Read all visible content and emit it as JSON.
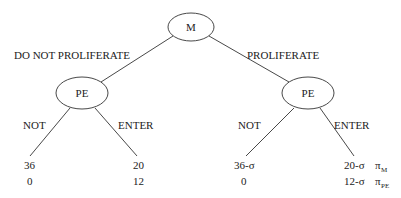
{
  "nodes": {
    "root": {
      "label": "M",
      "cx": 191,
      "cy": 27,
      "rx": 23,
      "ry": 14
    },
    "left": {
      "label": "PE",
      "cx": 82,
      "cy": 93,
      "rx": 26,
      "ry": 16
    },
    "right": {
      "label": "PE",
      "cx": 308,
      "cy": 93,
      "rx": 26,
      "ry": 16
    }
  },
  "actions": {
    "root_left": "DO NOT PROLIFERATE",
    "root_right": "PROLIFERATE",
    "left_not": "NOT",
    "left_enter": "ENTER",
    "right_not": "NOT",
    "right_enter": "ENTER"
  },
  "payoffs": {
    "ll": {
      "m": "36",
      "pe": "0"
    },
    "lr": {
      "m": "20",
      "pe": "12"
    },
    "rl": {
      "m": "36-σ",
      "pe": "0"
    },
    "rr": {
      "m": "20-σ",
      "pe": "12-σ"
    }
  },
  "legend": {
    "m_symbol": "π",
    "m_sub": "M",
    "pe_symbol": "π",
    "pe_sub": "PE"
  }
}
